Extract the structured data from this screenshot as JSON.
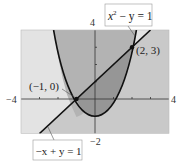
{
  "diagram": {
    "type": "system-of-inequalities-graph",
    "axes": {
      "x_min_label": "−4",
      "x_max_label": "4",
      "y_max_label": "4",
      "y_min_label": "−2",
      "xlim": [
        -4,
        4
      ],
      "ylim": [
        -2,
        4
      ]
    },
    "curves": [
      {
        "name": "parabola",
        "equation_base": "x",
        "equation_exp": "2",
        "equation_rest": " − y = 1",
        "form": "y = x^2 - 1"
      },
      {
        "name": "line",
        "equation": "−x + y = 1",
        "form": "y = x + 1"
      }
    ],
    "points": [
      {
        "label": "(−1, 0)",
        "x": -1,
        "y": 0
      },
      {
        "label": "(2, 3)",
        "x": 2,
        "y": 3
      }
    ],
    "colors": {
      "inside_parabola_above_line": "#b3b3b3",
      "inside_parabola_below_line": "#969696",
      "outside_parabola_below_line": "#c9c9c9",
      "outside_parabola_above_line": "#e3e3e3",
      "curve_stroke": "#111111"
    }
  }
}
